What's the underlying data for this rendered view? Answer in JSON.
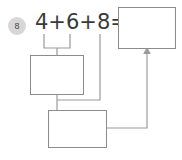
{
  "worksheet": {
    "problem_number": "8",
    "expression": "4+6+8=",
    "addends": [
      "4",
      "6",
      "8"
    ],
    "operators": [
      "+",
      "+"
    ],
    "equals_sign": "=",
    "stroke_color": "#8c8c8c",
    "text_color": "#3a3a3a",
    "badge_color": "#d7d7d7",
    "background_color": "#ffffff"
  },
  "boxes": {
    "answer": {
      "label": "answer-box",
      "value": ""
    },
    "partial_sum_1": {
      "label": "partial-sum-box-1",
      "value": ""
    },
    "partial_sum_2": {
      "label": "partial-sum-box-2",
      "value": ""
    }
  },
  "connectors": {
    "bracket_label": "bracket-under-4-plus-6",
    "from_bracket_to_box1": "line-bracket-to-partial-sum-box-1",
    "from_box1_to_box2": "line-partial-sum-box-1-to-partial-sum-box-2",
    "from_8_to_box2": "line-eight-to-partial-sum-box-2",
    "from_box2_to_answer": "arrow-partial-sum-box-2-to-answer-box",
    "arrowhead": "arrowhead-up"
  }
}
